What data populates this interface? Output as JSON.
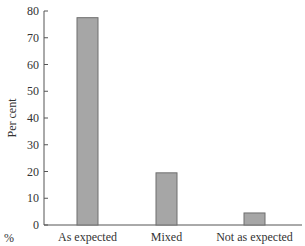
{
  "chart_data": {
    "type": "bar",
    "title": "",
    "xlabel": "",
    "ylabel": "Per cent",
    "unit_label": "%",
    "categories": [
      "As expected",
      "Mixed",
      "Not as expected"
    ],
    "values": [
      77.5,
      19.5,
      4.5
    ],
    "ylim": [
      0,
      80
    ],
    "yticks": [
      0,
      10,
      20,
      30,
      40,
      50,
      60,
      70,
      80
    ],
    "grid": false,
    "legend": null,
    "bar_color": "#a6a6a6",
    "bar_edge_color": "#6e6e6e"
  }
}
